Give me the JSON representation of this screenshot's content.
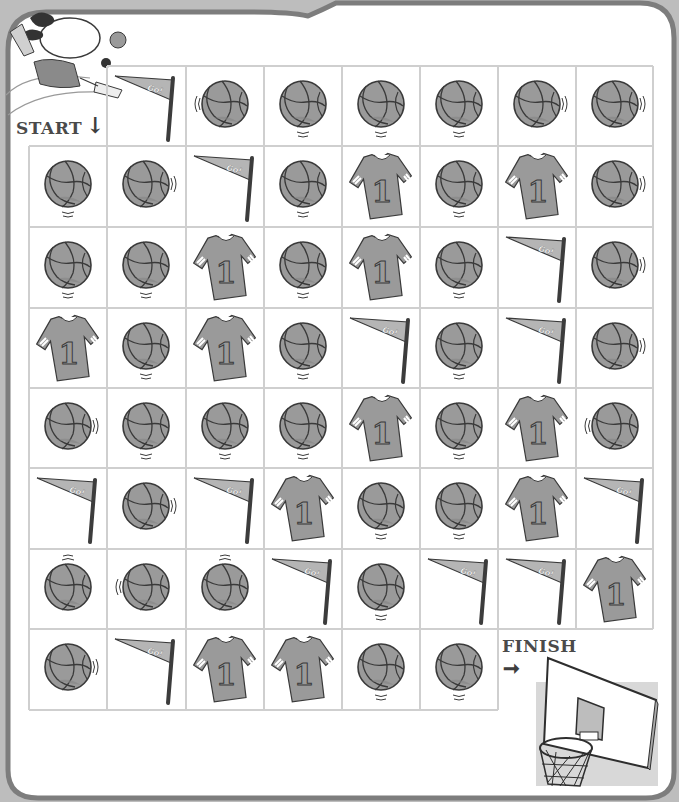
{
  "puzzle": {
    "start_label": "START",
    "start_arrow": "↓",
    "finish_label": "FINISH",
    "finish_arrow": "➞",
    "pennant_text": "Go!",
    "jersey_number": "1"
  },
  "colors": {
    "frame_border": "#7d7d7d",
    "outer_background": "#bdbdbd",
    "page_background": "#ffffff",
    "grid_line": "#cfcfcf",
    "item_fill": "#9a9a9a",
    "item_fill_dark": "#858585",
    "item_outline": "#3a3a3a",
    "label_text": "#4a4a4a"
  },
  "grid": {
    "rows": 8,
    "cols": 8,
    "cells": [
      [
        "start",
        "pennant",
        "ball",
        "ball",
        "ball",
        "ball",
        "ball",
        "ball"
      ],
      [
        "ball",
        "ball",
        "pennant",
        "ball",
        "jersey",
        "ball",
        "jersey",
        "ball"
      ],
      [
        "ball",
        "ball",
        "jersey",
        "ball",
        "jersey",
        "ball",
        "pennant",
        "ball"
      ],
      [
        "jersey",
        "ball",
        "jersey",
        "ball",
        "pennant",
        "ball",
        "pennant",
        "ball"
      ],
      [
        "ball",
        "ball",
        "ball",
        "ball",
        "jersey",
        "ball",
        "jersey",
        "ball"
      ],
      [
        "pennant",
        "ball",
        "pennant",
        "jersey",
        "ball",
        "ball",
        "jersey",
        "pennant"
      ],
      [
        "ball",
        "ball",
        "ball",
        "pennant",
        "ball",
        "pennant",
        "pennant",
        "jersey"
      ],
      [
        "ball",
        "pennant",
        "jersey",
        "jersey",
        "ball",
        "ball",
        "finish",
        "finish"
      ]
    ],
    "ball_motion": [
      [
        "",
        "",
        "left",
        "below",
        "below",
        "below",
        "right",
        "right"
      ],
      [
        "below",
        "right",
        "",
        "below",
        "",
        "below",
        "",
        "right"
      ],
      [
        "below",
        "below",
        "",
        "below",
        "",
        "below",
        "",
        "right"
      ],
      [
        "",
        "below",
        "",
        "below",
        "",
        "below",
        "",
        "right"
      ],
      [
        "right",
        "below",
        "below",
        "below",
        "",
        "below",
        "",
        "left"
      ],
      [
        "",
        "right",
        "",
        "",
        "below",
        "below",
        "",
        ""
      ],
      [
        "above",
        "left",
        "above",
        "",
        "below",
        "",
        "",
        ""
      ],
      [
        "right",
        "",
        "",
        "",
        "below",
        "below",
        "",
        ""
      ]
    ]
  }
}
